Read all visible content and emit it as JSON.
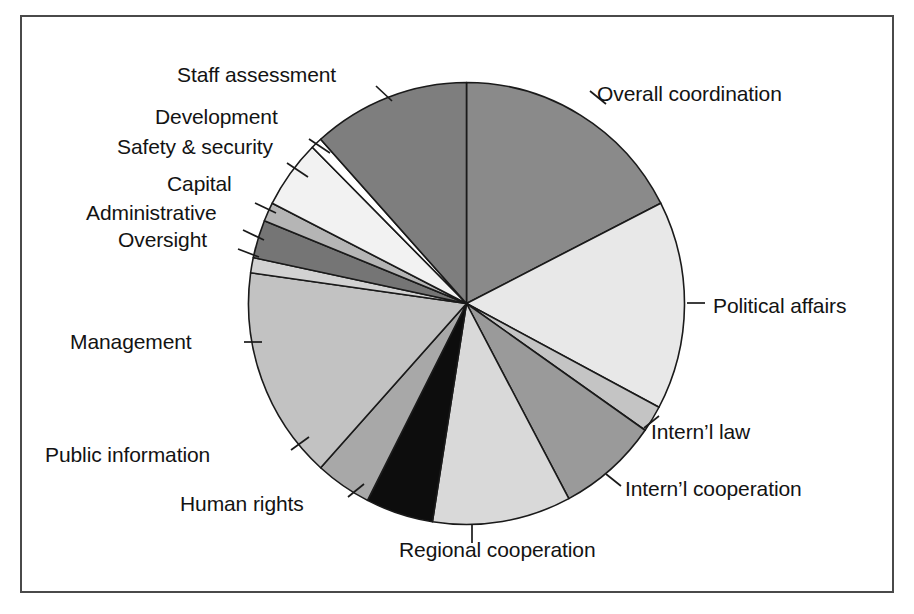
{
  "figure": {
    "title": "",
    "frame_color": "#4a4a4a",
    "background": "#ffffff"
  },
  "chart_data": {
    "type": "pie",
    "title": "",
    "xlabel": "",
    "ylabel": "",
    "legend_position": "callout-labels",
    "grid": false,
    "start_angle_deg": 0,
    "direction": "clockwise",
    "categories": [
      "Overall coordination",
      "Political affairs",
      "Intern’l law",
      "Intern’l cooperation",
      "Regional cooperation",
      "Human rights",
      "Public information",
      "Management",
      "Oversight",
      "Administrative",
      "Capital",
      "Safety & security",
      "Development",
      "Staff assessment"
    ],
    "values": [
      17.5,
      15.3,
      1.9,
      7.5,
      10.3,
      5.0,
      4.2,
      15.6,
      1.1,
      2.8,
      1.4,
      5.0,
      0.8,
      11.6
    ],
    "colors": [
      "#8a8a8a",
      "#e8e8e8",
      "#c4c4c4",
      "#9a9a9a",
      "#d9d9d9",
      "#0d0d0d",
      "#a8a8a8",
      "#c2c2c2",
      "#d2d2d2",
      "#757575",
      "#b5b5b5",
      "#f2f2f2",
      "#ffffff",
      "#7e7e7e"
    ],
    "slice_angles_deg": [
      {
        "label": "Overall coordination",
        "start": 0,
        "end": 63
      },
      {
        "label": "Political affairs",
        "start": 63,
        "end": 118
      },
      {
        "label": "Intern’l law",
        "start": 118,
        "end": 125
      },
      {
        "label": "Intern’l cooperation",
        "start": 125,
        "end": 152
      },
      {
        "label": "Regional cooperation",
        "start": 152,
        "end": 189
      },
      {
        "label": "Human rights",
        "start": 189,
        "end": 207
      },
      {
        "label": "Public information",
        "start": 207,
        "end": 222
      },
      {
        "label": "Management",
        "start": 222,
        "end": 278
      },
      {
        "label": "Oversight",
        "start": 278,
        "end": 282
      },
      {
        "label": "Administrative",
        "start": 282,
        "end": 292
      },
      {
        "label": "Capital",
        "start": 292,
        "end": 297
      },
      {
        "label": "Safety & security",
        "start": 297,
        "end": 315
      },
      {
        "label": "Development",
        "start": 315,
        "end": 318
      },
      {
        "label": "Staff assessment",
        "start": 318,
        "end": 360
      }
    ]
  },
  "labels": {
    "staff_assessment": "Staff assessment",
    "development": "Development",
    "safety_security": "Safety & security",
    "capital": "Capital",
    "administrative": "Administrative",
    "oversight": "Oversight",
    "management": "Management",
    "public_information": "Public information",
    "human_rights": "Human rights",
    "regional_cooperation": "Regional cooperation",
    "internl_cooperation": "Intern’l cooperation",
    "internl_law": "Intern’l law",
    "political_affairs": "Political affairs",
    "overall_coordination": "Overall coordination"
  }
}
